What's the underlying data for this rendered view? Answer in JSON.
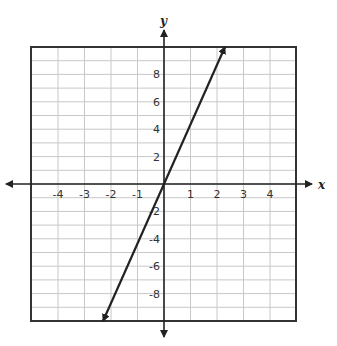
{
  "chart_data": {
    "type": "line",
    "title": "",
    "xlabel": "x",
    "ylabel": "y",
    "xlim": [
      -5,
      5
    ],
    "ylim": [
      -10,
      10
    ],
    "grid": true,
    "x_grid_step": 1,
    "y_grid_step": 1,
    "x_ticks": [
      -4,
      -3,
      -2,
      -1,
      1,
      2,
      3,
      4
    ],
    "x_tick_labels": [
      "-4",
      "-3",
      "-2",
      "-1",
      "1",
      "2",
      "3",
      "4"
    ],
    "y_ticks": [
      8,
      6,
      4,
      2,
      -2,
      -4,
      -6,
      -8
    ],
    "y_tick_labels": [
      "8",
      "6",
      "4",
      "2",
      "-2",
      "-4",
      "-6",
      "-8"
    ],
    "series": [
      {
        "name": "line",
        "equation": "y = 4x",
        "x": [
          -2.3,
          0,
          1,
          2.3
        ],
        "y": [
          -10,
          0,
          4,
          10
        ],
        "arrows": "both"
      }
    ],
    "colors": {
      "line": "#222222",
      "grid": "#c8c8c8",
      "border": "#333333"
    }
  }
}
